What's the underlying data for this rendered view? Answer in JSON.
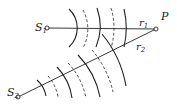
{
  "diagram": {
    "labels": {
      "s1": "S",
      "s1_sub": "1",
      "s2": "S",
      "s2_sub": "2",
      "p": "P",
      "r1": "r",
      "r1_sub": "1",
      "r2": "r",
      "r2_sub": "2"
    },
    "points": {
      "S1": [
        47,
        28
      ],
      "S2": [
        18,
        97
      ],
      "P": [
        156,
        29
      ]
    },
    "wavefronts": {
      "S1": {
        "solid_radii": [
          26,
          54,
          81
        ],
        "dashed_radii": [
          40,
          68
        ]
      },
      "S2": {
        "solid_radii": [
          28,
          56,
          84,
          112
        ],
        "dashed_radii": [
          42,
          70,
          98
        ]
      }
    },
    "colors": {
      "stroke": "#222222",
      "background": "#ffffff"
    }
  }
}
